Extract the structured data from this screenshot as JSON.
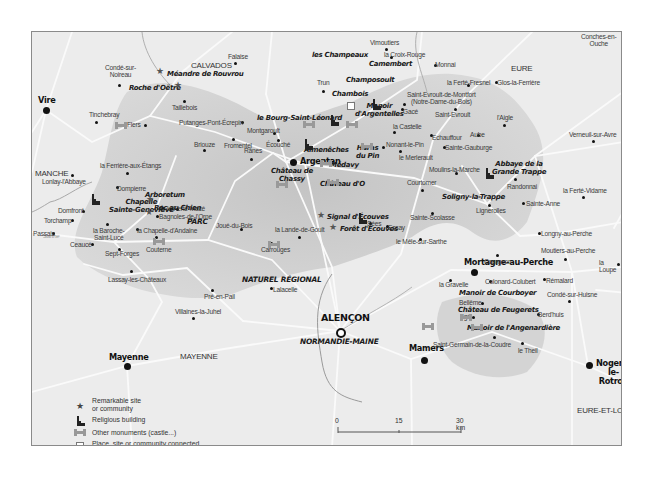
{
  "regions": [
    {
      "id": "calvados",
      "label": "CALVADOS",
      "x": 159,
      "y": 30
    },
    {
      "id": "eure",
      "label": "EURE",
      "x": 479,
      "y": 33
    },
    {
      "id": "manche",
      "label": "MANCHE",
      "x": 3,
      "y": 138
    },
    {
      "id": "mayenne",
      "label": "MAYENNE",
      "x": 148,
      "y": 321
    },
    {
      "id": "eure-et-loir",
      "label": "EURE-ET-LOIR",
      "x": 545,
      "y": 375
    }
  ],
  "park": {
    "line1": "PARC",
    "line2": "NATUREL RÉGIONAL",
    "line3": "NORMANDIE-MAINE"
  },
  "river": {
    "label": "Sarthe"
  },
  "cities": [
    {
      "id": "vire",
      "label": "Vire",
      "type": "city",
      "lx": 6,
      "ly": 66,
      "dx": 14,
      "dy": 78
    },
    {
      "id": "argentan",
      "label": "Argentan",
      "type": "city",
      "lx": 261,
      "ly": 128,
      "dx": 254,
      "dy": 130
    },
    {
      "id": "mortagne",
      "label": "Mortagne-au-Perche",
      "type": "city",
      "lx": 516,
      "ly": 226,
      "dx": 540,
      "dy": 240,
      "center": true
    },
    {
      "id": "mayenne-city",
      "label": "Mayenne",
      "type": "city",
      "lx": 77,
      "ly": 322,
      "dx": 95,
      "dy": 334
    },
    {
      "id": "mamers",
      "label": "Mamers",
      "type": "city",
      "lx": 348,
      "ly": 314,
      "dx": 379,
      "dy": 327
    },
    {
      "id": "nogent",
      "label": "Nogent-le-\nRotrou",
      "type": "city",
      "lx": 566,
      "ly": 330,
      "dx": 556,
      "dy": 334
    }
  ],
  "prefecture": {
    "label": "ALENÇON",
    "lx": 288,
    "ly": 281,
    "dx": 308,
    "dy": 299
  },
  "towns": [
    {
      "label": "Condé-sur-\nNoireau",
      "x": 104,
      "y": 63,
      "dx": 118,
      "dy": 84
    },
    {
      "label": "Falaise",
      "x": 227,
      "y": 52,
      "dx": 234,
      "dy": 62
    },
    {
      "label": "Vimoutiers",
      "x": 369,
      "y": 38,
      "dx": 385,
      "dy": 48
    },
    {
      "label": "la Croix-Rouge",
      "x": 383,
      "y": 50,
      "dx": 390,
      "dy": 56
    },
    {
      "label": "Monnai",
      "x": 434,
      "y": 60,
      "dx": 434,
      "dy": 64
    },
    {
      "label": "Conches-en-\nOuche",
      "x": 580,
      "y": 32,
      "dx": 588,
      "dy": 28
    },
    {
      "label": "Taillebois",
      "x": 171,
      "y": 103,
      "dx": 183,
      "dy": 100
    },
    {
      "label": "Tinchebray",
      "x": 88,
      "y": 110,
      "dx": 95,
      "dy": 121
    },
    {
      "label": "Flers",
      "x": 126,
      "y": 120,
      "dx": 144,
      "dy": 124
    },
    {
      "label": "Putanges-Pont-Écrepin",
      "x": 178,
      "y": 118,
      "dx": 241,
      "dy": 121
    },
    {
      "label": "Trun",
      "x": 316,
      "y": 78,
      "dx": 322,
      "dy": 90
    },
    {
      "label": "Montgaroult",
      "x": 246,
      "y": 126,
      "dx": 273,
      "dy": 132
    },
    {
      "label": "la Ferté-Fresnel",
      "x": 446,
      "y": 78,
      "dx": 467,
      "dy": 84
    },
    {
      "label": "Glos-la-Ferrière",
      "x": 496,
      "y": 78,
      "dx": 495,
      "dy": 81
    },
    {
      "label": "Saint-Evroult-de-Montfort\n(Notre-Dame-du-Bois)",
      "x": 406,
      "y": 90,
      "dx": 403,
      "dy": 103
    },
    {
      "label": "Gacé",
      "x": 402,
      "y": 107,
      "dx": 401,
      "dy": 108
    },
    {
      "label": "Saint-Evroult",
      "x": 434,
      "y": 110,
      "dx": 454,
      "dy": 108
    },
    {
      "label": "la Castelle",
      "x": 392,
      "y": 122,
      "dx": 393,
      "dy": 131
    },
    {
      "label": "l'Aigle",
      "x": 496,
      "y": 113,
      "dx": 503,
      "dy": 124
    },
    {
      "label": "Echauffour",
      "x": 431,
      "y": 133,
      "dx": 430,
      "dy": 134
    },
    {
      "label": "Aube",
      "x": 469,
      "y": 130,
      "dx": 477,
      "dy": 134
    },
    {
      "label": "Verneuil-sur-Avre",
      "x": 568,
      "y": 130,
      "dx": 592,
      "dy": 140
    },
    {
      "label": "Nonant-le-Pin",
      "x": 385,
      "y": 140,
      "dx": 382,
      "dy": 146
    },
    {
      "label": "Sainte-Gauburge",
      "x": 444,
      "y": 143,
      "dx": 443,
      "dy": 146
    },
    {
      "label": "le Merlerault",
      "x": 398,
      "y": 153,
      "dx": 399,
      "dy": 150
    },
    {
      "label": "Moulins-la-Marche",
      "x": 428,
      "y": 165,
      "dx": 455,
      "dy": 172
    },
    {
      "label": "Rânes",
      "x": 243,
      "y": 146,
      "dx": 250,
      "dy": 158
    },
    {
      "label": "Briouze",
      "x": 193,
      "y": 140,
      "dx": 203,
      "dy": 149
    },
    {
      "label": "Fromentel",
      "x": 223,
      "y": 141,
      "dx": 232,
      "dy": 138
    },
    {
      "label": "Écouché",
      "x": 265,
      "y": 140,
      "dx": 277,
      "dy": 139
    },
    {
      "label": "la Ferrière-aux-Étangs",
      "x": 99,
      "y": 161,
      "dx": 126,
      "dy": 172
    },
    {
      "label": "Lonlay-l'Abbaye",
      "x": 41,
      "y": 177,
      "dx": 71,
      "dy": 174
    },
    {
      "label": "Domfront",
      "x": 57,
      "y": 206,
      "dx": 82,
      "dy": 210
    },
    {
      "label": "Dompierre",
      "x": 116,
      "y": 184,
      "dx": 116,
      "dy": 186
    },
    {
      "label": "la Ferté-Macé",
      "x": 166,
      "y": 204,
      "dx": 176,
      "dy": 208
    },
    {
      "label": "Joué-du-Bois",
      "x": 215,
      "y": 221,
      "dx": 240,
      "dy": 228
    },
    {
      "label": "la Lande-de-Goult",
      "x": 274,
      "y": 225,
      "dx": 298,
      "dy": 236
    },
    {
      "label": "Carrouges",
      "x": 260,
      "y": 245,
      "dx": 270,
      "dy": 242
    },
    {
      "label": "Sées",
      "x": 366,
      "y": 219,
      "dx": 369,
      "dy": 222
    },
    {
      "label": "Courtomer",
      "x": 406,
      "y": 178,
      "dx": 421,
      "dy": 189
    },
    {
      "label": "Randonnai",
      "x": 506,
      "y": 182,
      "dx": 514,
      "dy": 178
    },
    {
      "label": "Lignerolles",
      "x": 475,
      "y": 206,
      "dx": 488,
      "dy": 204
    },
    {
      "label": "Sainte-Anne",
      "x": 525,
      "y": 199,
      "dx": 522,
      "dy": 202
    },
    {
      "label": "la Ferté-Vidame",
      "x": 562,
      "y": 186,
      "dx": 582,
      "dy": 196
    },
    {
      "label": "Sainte-Scolasse",
      "x": 409,
      "y": 213,
      "dx": 431,
      "dy": 212
    },
    {
      "label": "Essay",
      "x": 387,
      "y": 223,
      "dx": 386,
      "dy": 225
    },
    {
      "label": "le Mêle-sur-Sarthe",
      "x": 395,
      "y": 237,
      "dx": 419,
      "dy": 238
    },
    {
      "label": "Torchamp",
      "x": 43,
      "y": 216,
      "dx": 71,
      "dy": 219
    },
    {
      "label": "Passais",
      "x": 32,
      "y": 229,
      "dx": 52,
      "dy": 232
    },
    {
      "label": "la Baroche-\nSaint-Lucé",
      "x": 92,
      "y": 226,
      "dx": 106,
      "dy": 223
    },
    {
      "label": "Bagnoles-de-l'Orne",
      "x": 158,
      "y": 212,
      "dx": 156,
      "dy": 215
    },
    {
      "label": "la Chapelle-d'Andaine",
      "x": 136,
      "y": 226,
      "dx": 136,
      "dy": 228
    },
    {
      "label": "Ceaucé",
      "x": 69,
      "y": 240,
      "dx": 91,
      "dy": 243
    },
    {
      "label": "Couterne",
      "x": 145,
      "y": 245,
      "dx": 155,
      "dy": 236
    },
    {
      "label": "Sept-Forges",
      "x": 104,
      "y": 249,
      "dx": 118,
      "dy": 248
    },
    {
      "label": "Lassay-les-Châteaux",
      "x": 107,
      "y": 275,
      "dx": 130,
      "dy": 270
    },
    {
      "label": "Pré-en-Pail",
      "x": 203,
      "y": 292,
      "dx": 211,
      "dy": 289
    },
    {
      "label": "Lalacelle",
      "x": 272,
      "y": 285,
      "dx": 270,
      "dy": 287
    },
    {
      "label": "Villaines-la-Juhel",
      "x": 174,
      "y": 307,
      "dx": 192,
      "dy": 317
    },
    {
      "label": "Longny-au-Perche",
      "x": 540,
      "y": 229,
      "dx": 538,
      "dy": 232
    },
    {
      "label": "Courgeon",
      "x": 483,
      "y": 257,
      "dx": 496,
      "dy": 254
    },
    {
      "label": "Moutiers-au-Perche",
      "x": 540,
      "y": 246,
      "dx": 564,
      "dy": 258
    },
    {
      "label": "la Loupe",
      "x": 598,
      "y": 258,
      "dx": 617,
      "dy": 263
    },
    {
      "label": "la Gravelle",
      "x": 438,
      "y": 280,
      "dx": 449,
      "dy": 279
    },
    {
      "label": "Colonard-Colubert",
      "x": 484,
      "y": 277,
      "dx": 489,
      "dy": 280
    },
    {
      "label": "Rémalard",
      "x": 545,
      "y": 276,
      "dx": 543,
      "dy": 278
    },
    {
      "label": "Bellême",
      "x": 458,
      "y": 298,
      "dx": 481,
      "dy": 302
    },
    {
      "label": "Condé-sur-Huisne",
      "x": 546,
      "y": 290,
      "dx": 568,
      "dy": 300
    },
    {
      "label": "Berd'huis",
      "x": 537,
      "y": 310,
      "dx": 537,
      "dy": 313
    },
    {
      "label": "Igé",
      "x": 461,
      "y": 312,
      "dx": 472,
      "dy": 316
    },
    {
      "label": "Saint-Germain-de-la-Coudre",
      "x": 432,
      "y": 340,
      "dx": 493,
      "dy": 336
    },
    {
      "label": "le Theil",
      "x": 517,
      "y": 346,
      "dx": 521,
      "dy": 342
    }
  ],
  "sites": [
    {
      "label": "Méandre de Rouvrou",
      "x": 166,
      "y": 69,
      "star": [
        159,
        70
      ]
    },
    {
      "label": "Roche d'Oëtre",
      "x": 128,
      "y": 83,
      "star": [
        177,
        84
      ]
    },
    {
      "label": "les Champeaux",
      "x": 311,
      "y": 50
    },
    {
      "label": "Camembert",
      "x": 368,
      "y": 59
    },
    {
      "label": "Champosoult",
      "x": 345,
      "y": 75
    },
    {
      "label": "Chambois",
      "x": 331,
      "y": 89
    },
    {
      "label": "Manoir\nd'Argentelles",
      "x": 354,
      "y": 101
    },
    {
      "label": "le Bourg-Saint-Léonard",
      "x": 256,
      "y": 113
    },
    {
      "label": "Almenêches",
      "x": 303,
      "y": 145
    },
    {
      "label": "Haras\ndu Pin",
      "x": 355,
      "y": 143
    },
    {
      "label": "Médavy",
      "x": 329,
      "y": 160
    },
    {
      "label": "Château de\nChassy",
      "x": 270,
      "y": 166
    },
    {
      "label": "Château d'O",
      "x": 319,
      "y": 179
    },
    {
      "label": "Abbaye de la\nGrande Trappe",
      "x": 491,
      "y": 159
    },
    {
      "label": "Soligny-la-Trappe",
      "x": 441,
      "y": 192
    },
    {
      "label": "Signal d'Écouves",
      "x": 326,
      "y": 212,
      "star": [
        320,
        214
      ]
    },
    {
      "label": "Forêt d'Écouves",
      "x": 339,
      "y": 224,
      "star": [
        332,
        226
      ]
    },
    {
      "label": "Arboretum",
      "x": 144,
      "y": 190,
      "star": [
        161,
        207
      ]
    },
    {
      "label": "Chapelle\nSainte-Geneviève",
      "x": 108,
      "y": 197,
      "star": [
        149,
        198
      ]
    },
    {
      "label": "Roc au Chien",
      "x": 153,
      "y": 203,
      "star": [
        148,
        211
      ]
    },
    {
      "label": "Manoir de Courboyer",
      "x": 458,
      "y": 288
    },
    {
      "label": "Château de Feugerets",
      "x": 457,
      "y": 305
    },
    {
      "label": "Manoir de l'Angenardière",
      "x": 466,
      "y": 323
    }
  ],
  "monuments": [
    [
      114,
      121
    ],
    [
      302,
      120
    ],
    [
      345,
      120
    ],
    [
      360,
      142
    ],
    [
      319,
      159
    ],
    [
      326,
      178
    ],
    [
      275,
      180
    ],
    [
      267,
      240
    ],
    [
      152,
      237
    ],
    [
      421,
      322
    ],
    [
      459,
      313
    ],
    [
      470,
      323
    ]
  ],
  "churches": [
    [
      90,
      193
    ],
    [
      329,
      114
    ],
    [
      303,
      138
    ],
    [
      371,
      98
    ],
    [
      357,
      212
    ],
    [
      484,
      167
    ]
  ],
  "ww2_squares": [
    [
      346,
      101
    ]
  ],
  "legend": {
    "items": [
      {
        "icon": "star-icon",
        "text": "Remarkable site\nor community"
      },
      {
        "icon": "church-icon",
        "text": "Religious building"
      },
      {
        "icon": "monument-icon",
        "text": "Other monuments (castle...)"
      },
      {
        "icon": "ww2-square-icon",
        "text": "Place, site or community connected\nwith the Second World War"
      }
    ]
  },
  "scale": {
    "ticks": [
      "0",
      "15",
      "30 km"
    ]
  },
  "colors": {
    "background": "#ececec",
    "park": "#c9c9c9",
    "roads": "#fafafa",
    "border": "#8a8a8a",
    "river": "#a8a8a8",
    "text": "#222222"
  }
}
